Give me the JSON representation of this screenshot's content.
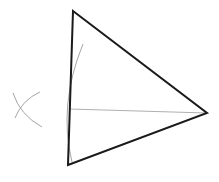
{
  "diagram": {
    "type": "geometric-construction",
    "colors": {
      "background": "#ffffff",
      "triangle_stroke": "#1a1a1a",
      "construction_stroke": "#9a9a9a"
    },
    "triangle": {
      "vertices": {
        "top": [
          73,
          11
        ],
        "bottom": [
          68,
          165
        ],
        "right": [
          207,
          113
        ]
      },
      "stroke_width": 2
    },
    "segment": {
      "from": [
        69,
        109
      ],
      "to": [
        207,
        113
      ],
      "stroke_width": 0.8
    },
    "construction_arcs": [
      {
        "name": "large-arc",
        "path": "M83,44 Q58,105 72,162"
      },
      {
        "name": "left-arc-1",
        "path": "M13,93 Q20,115 42,127"
      },
      {
        "name": "left-arc-2",
        "path": "M40,92 Q22,100 15,118"
      }
    ]
  }
}
